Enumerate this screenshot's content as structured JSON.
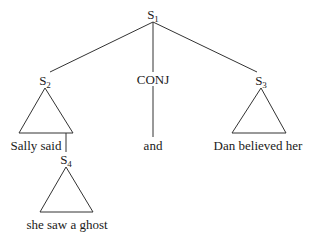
{
  "diagram": {
    "type": "syntax-tree",
    "nodes": {
      "s1": {
        "base": "S",
        "sub": "1"
      },
      "s2": {
        "base": "S",
        "sub": "2"
      },
      "conj": {
        "label": "CONJ"
      },
      "s3": {
        "base": "S",
        "sub": "3"
      },
      "s4": {
        "base": "S",
        "sub": "4"
      }
    },
    "leaves": {
      "s2_text": "Sally said",
      "conj_text": "and",
      "s3_text": "Dan believed her",
      "s4_text": "she saw a ghost"
    },
    "colors": {
      "line": "#333333",
      "text": "#1a1a1a",
      "background": "#ffffff"
    }
  }
}
